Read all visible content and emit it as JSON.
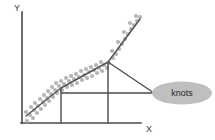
{
  "figure": {
    "axes": {
      "y_label": "Y",
      "x_label": "X",
      "axis_color": "#4a4a4a",
      "y_axis": {
        "x": 22,
        "y_top": 12,
        "y_bottom": 123
      },
      "x_axis": {
        "y": 123,
        "x_left": 22,
        "x_right": 141
      },
      "y_label_pos": {
        "x": 14,
        "y": 9
      },
      "x_label_pos": {
        "x": 147,
        "y": 130
      }
    },
    "annotation": {
      "label": "knots",
      "shape": "ellipse",
      "fill_color": "#bfbfbf",
      "center": {
        "cx": 182,
        "cy": 93
      },
      "rx": 30,
      "ry": 11.5
    }
  },
  "chart_data": {
    "type": "scatter",
    "title": "",
    "xlabel": "X",
    "ylabel": "Y",
    "grid": false,
    "legend": null,
    "fit": {
      "name": "piecewise-linear spline fit",
      "color": "#555555",
      "vertices": [
        {
          "x": 26,
          "y": 116
        },
        {
          "x": 61,
          "y": 88
        },
        {
          "x": 108,
          "y": 62
        },
        {
          "x": 140,
          "y": 19
        }
      ]
    },
    "knots": [
      {
        "id": "knot-1",
        "x": 61,
        "y": 88
      },
      {
        "id": "knot-2",
        "x": 108,
        "y": 62
      }
    ],
    "drop_lines": [
      {
        "x": 61,
        "y_top": 88,
        "y_bottom": 123
      },
      {
        "x": 108,
        "y_top": 62,
        "y_bottom": 123
      }
    ],
    "connector_line": {
      "x1": 61,
      "y1": 93,
      "x2": 152,
      "y2": 93
    },
    "leader_lines": [
      {
        "x1": 152,
        "y1": 93,
        "x2": 108,
        "y2": 62
      }
    ],
    "point_style": {
      "color": "#b5b5b5",
      "radius": 2.1
    },
    "points": [
      {
        "x": 27,
        "y": 121
      },
      {
        "x": 30,
        "y": 115
      },
      {
        "x": 26,
        "y": 112
      },
      {
        "x": 33,
        "y": 118
      },
      {
        "x": 34,
        "y": 110
      },
      {
        "x": 31,
        "y": 107
      },
      {
        "x": 37,
        "y": 113
      },
      {
        "x": 38,
        "y": 106
      },
      {
        "x": 35,
        "y": 103
      },
      {
        "x": 41,
        "y": 109
      },
      {
        "x": 43,
        "y": 102
      },
      {
        "x": 40,
        "y": 99
      },
      {
        "x": 45,
        "y": 105
      },
      {
        "x": 47,
        "y": 98
      },
      {
        "x": 44,
        "y": 95
      },
      {
        "x": 49,
        "y": 101
      },
      {
        "x": 51,
        "y": 94
      },
      {
        "x": 48,
        "y": 91
      },
      {
        "x": 53,
        "y": 97
      },
      {
        "x": 55,
        "y": 90
      },
      {
        "x": 52,
        "y": 87
      },
      {
        "x": 57,
        "y": 93
      },
      {
        "x": 59,
        "y": 86
      },
      {
        "x": 56,
        "y": 83
      },
      {
        "x": 62,
        "y": 90
      },
      {
        "x": 64,
        "y": 84
      },
      {
        "x": 61,
        "y": 81
      },
      {
        "x": 67,
        "y": 87
      },
      {
        "x": 69,
        "y": 81
      },
      {
        "x": 66,
        "y": 78
      },
      {
        "x": 72,
        "y": 85
      },
      {
        "x": 74,
        "y": 79
      },
      {
        "x": 71,
        "y": 76
      },
      {
        "x": 77,
        "y": 83
      },
      {
        "x": 79,
        "y": 77
      },
      {
        "x": 76,
        "y": 74
      },
      {
        "x": 82,
        "y": 80
      },
      {
        "x": 84,
        "y": 75
      },
      {
        "x": 81,
        "y": 71
      },
      {
        "x": 87,
        "y": 78
      },
      {
        "x": 89,
        "y": 72
      },
      {
        "x": 86,
        "y": 69
      },
      {
        "x": 92,
        "y": 76
      },
      {
        "x": 94,
        "y": 70
      },
      {
        "x": 91,
        "y": 67
      },
      {
        "x": 97,
        "y": 73
      },
      {
        "x": 99,
        "y": 68
      },
      {
        "x": 96,
        "y": 65
      },
      {
        "x": 102,
        "y": 71
      },
      {
        "x": 104,
        "y": 65
      },
      {
        "x": 101,
        "y": 62
      },
      {
        "x": 107,
        "y": 68
      },
      {
        "x": 109,
        "y": 63
      },
      {
        "x": 113,
        "y": 58
      },
      {
        "x": 116,
        "y": 54
      },
      {
        "x": 112,
        "y": 51
      },
      {
        "x": 119,
        "y": 49
      },
      {
        "x": 122,
        "y": 44
      },
      {
        "x": 118,
        "y": 42
      },
      {
        "x": 125,
        "y": 39
      },
      {
        "x": 128,
        "y": 34
      },
      {
        "x": 124,
        "y": 32
      },
      {
        "x": 131,
        "y": 29
      },
      {
        "x": 134,
        "y": 25
      },
      {
        "x": 130,
        "y": 23
      },
      {
        "x": 137,
        "y": 21
      },
      {
        "x": 140,
        "y": 17
      },
      {
        "x": 136,
        "y": 16
      }
    ]
  }
}
